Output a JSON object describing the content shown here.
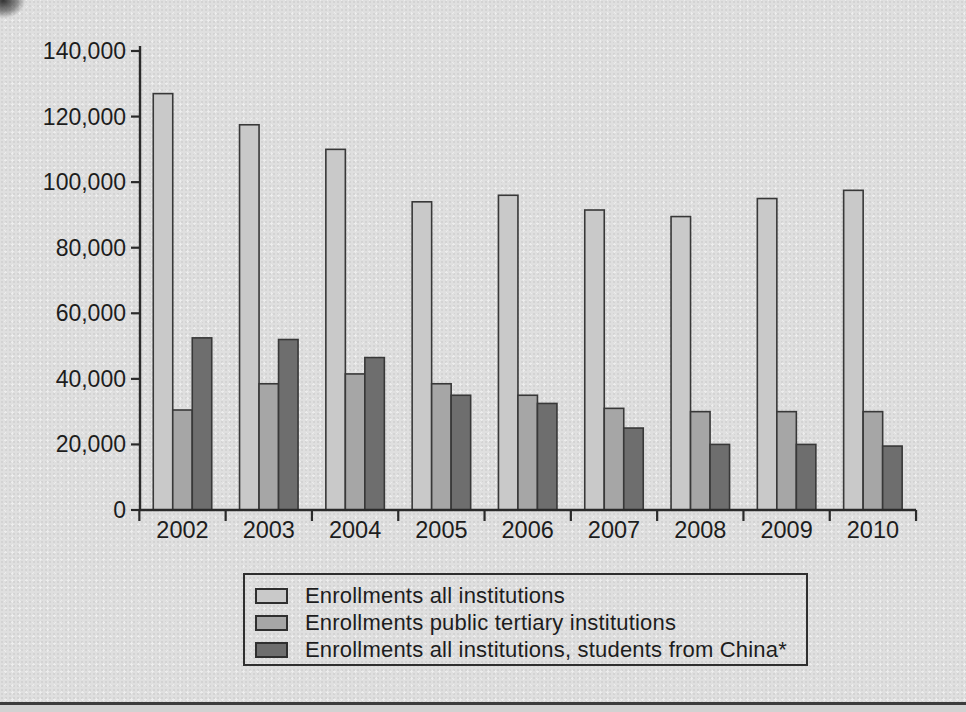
{
  "figure": {
    "background_color": "#dfdfdf",
    "axis_color": "#2a2a2a",
    "text_color": "#1d1d1d",
    "bar_border_color": "#383838",
    "legend_border_color": "#2f2f2f",
    "footer_rule_color": "#3c3c3c"
  },
  "chart_data": {
    "type": "bar",
    "title": "",
    "xlabel": "",
    "ylabel": "",
    "categories": [
      "2002",
      "2003",
      "2004",
      "2005",
      "2006",
      "2007",
      "2008",
      "2009",
      "2010"
    ],
    "series": [
      {
        "name": "Enrollments all institutions",
        "color": "#c9c9c9",
        "values": [
          127000,
          117500,
          110000,
          94000,
          96000,
          91500,
          89500,
          95000,
          97500
        ]
      },
      {
        "name": "Enrollments public tertiary institutions",
        "color": "#a6a6a6",
        "values": [
          30500,
          38500,
          41500,
          38500,
          35000,
          31000,
          30000,
          30000,
          30000
        ]
      },
      {
        "name": "Enrollments all institutions, students from China*",
        "color": "#6e6e6e",
        "values": [
          52500,
          52000,
          46500,
          35000,
          32500,
          25000,
          20000,
          20000,
          19500
        ]
      }
    ],
    "ylim": [
      0,
      140000
    ],
    "ytick_step": 20000,
    "ytick_labels": [
      "0",
      "20,000",
      "40,000",
      "60,000",
      "80,000",
      "100,000",
      "120,000",
      "140,000"
    ],
    "grid": false,
    "legend_position": "bottom"
  }
}
